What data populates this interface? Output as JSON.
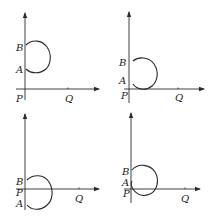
{
  "figure": {
    "panels": [
      {
        "id": "panel-1",
        "labels": {
          "B": "B",
          "A": "A",
          "P": "P",
          "Q": "Q"
        },
        "description": "Arc BA entirely above horizontal axis, right of vertical axis"
      },
      {
        "id": "panel-2",
        "labels": {
          "B": "B",
          "A": "A",
          "P": "P",
          "Q": "Q"
        },
        "description": "Arc BA touching the horizontal axis near P"
      },
      {
        "id": "panel-3",
        "labels": {
          "B": "B",
          "A": "A",
          "P": "P",
          "Q": "Q"
        },
        "description": "Arc from B above axis to A below axis, P between"
      },
      {
        "id": "panel-4",
        "labels": {
          "B": "B",
          "A": "A",
          "P": "P",
          "Q": "Q"
        },
        "description": "Arc BA crossing below horizontal axis"
      }
    ]
  }
}
